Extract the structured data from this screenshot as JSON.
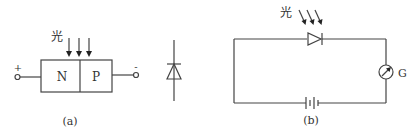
{
  "figure_a": {
    "light_label": "光",
    "n_region": "N",
    "p_region": "P",
    "plus_terminal": "+",
    "minus_terminal": "-",
    "caption": "(a)"
  },
  "figure_b": {
    "light_label": "光",
    "galvanometer_label": "G",
    "caption": "(b)"
  },
  "colors": {
    "line": "#444444",
    "background": "#ffffff"
  }
}
